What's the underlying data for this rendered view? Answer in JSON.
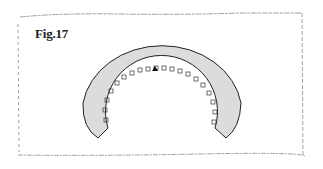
{
  "figure": {
    "label": "Fig.17",
    "shape": "horseshoe-arc-with-notches",
    "fill_color": "#dcdcdc",
    "stroke_color": "#222222",
    "border_color": "#8a8a8a"
  }
}
